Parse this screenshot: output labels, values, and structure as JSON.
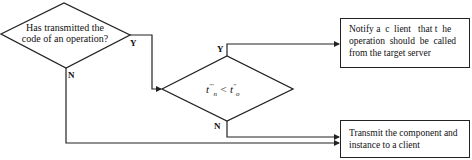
{
  "diagram": {
    "decision1": {
      "line1": "Has transmitted the",
      "line2": "code of an operation?",
      "yes_label": "Y",
      "no_label": "N"
    },
    "decision2": {
      "condition_left_base": "t",
      "condition_left_sup": "'''",
      "condition_left_sub": "n",
      "condition_op": " < ",
      "condition_right_base": "t",
      "condition_right_sup": "''",
      "condition_right_sub": "o",
      "yes_label": "Y",
      "no_label": "N"
    },
    "process_notify": {
      "text": "Notify a  c  lient   that t  he operation  should  be  called from the target server"
    },
    "process_transmit": {
      "text": "Transmit the component and instance to a client"
    },
    "colors": {
      "stroke": "#222222",
      "background": "#ffffff"
    }
  }
}
